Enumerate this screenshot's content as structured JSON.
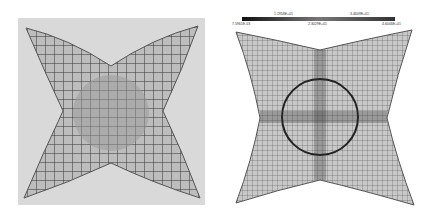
{
  "figure": {
    "left_panel": {
      "description": "Photograph of deformed sheet with grid pattern"
    },
    "right_panel": {
      "description": "FEM simulation mesh with colorbar",
      "colorbar": {
        "top_labels": [
          "1.1958E+01",
          "3.4609E+01"
        ],
        "bottom_labels": [
          "7.5961E-03",
          "2.3029E+01",
          "4.6046E+01"
        ]
      }
    }
  }
}
